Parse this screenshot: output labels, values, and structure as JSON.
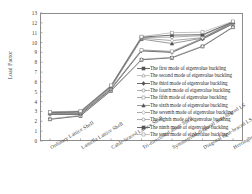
{
  "figure": {
    "title_remnant": "",
    "y_axis_label": "Load Factor",
    "x_axis_label": ""
  },
  "chart_data": {
    "type": "line",
    "title": "",
    "xlabel": "",
    "ylabel": "Load Factor",
    "ylim": [
      0,
      13
    ],
    "yticks": [
      0,
      1,
      2,
      3,
      4,
      5,
      6,
      7,
      8,
      9,
      10,
      11,
      12,
      13
    ],
    "grid": false,
    "legend_position": "lower-right-inside",
    "categories": [
      "Ordinary Lattice Shell",
      "Lamella Lattice Shell",
      "Cable-braced Lattice Shell",
      "Tri-direction Lattice Shell",
      "Symmetrical diagonal strut-braced LS",
      "Diagonal strut-braced LS",
      "Herringbone strut-braced LS"
    ],
    "series": [
      {
        "name": "The first mode of eigenvalue buckling",
        "marker": "filled-square",
        "values": [
          2.2,
          2.55,
          5.1,
          8.25,
          8.45,
          9.6,
          11.55
        ]
      },
      {
        "name": "The second mode of eigenvalue buckling",
        "marker": "open-triangle",
        "values": [
          2.25,
          2.6,
          5.15,
          8.3,
          8.5,
          9.65,
          11.6
        ]
      },
      {
        "name": "The third mode of eigenvalue buckling",
        "marker": "filled-diamond",
        "values": [
          2.7,
          2.7,
          5.25,
          9.15,
          9.0,
          10.35,
          11.9
        ]
      },
      {
        "name": "The fourth mode of eigenvalue buckling",
        "marker": "open-circle",
        "values": [
          2.75,
          2.75,
          5.3,
          9.2,
          9.05,
          10.4,
          11.95
        ]
      },
      {
        "name": "The fifth mode of eigenvalue buckling",
        "marker": "open-square",
        "values": [
          2.8,
          2.8,
          5.35,
          9.25,
          9.1,
          10.45,
          12.0
        ]
      },
      {
        "name": "The sixth mode of eigenvalue buckling",
        "marker": "filled-triangle",
        "values": [
          2.85,
          2.85,
          5.45,
          10.35,
          9.9,
          10.45,
          12.05
        ]
      },
      {
        "name": "The seventh mode of eigenvalue buckling",
        "marker": "open-diamond",
        "values": [
          2.88,
          2.9,
          5.5,
          10.45,
          10.2,
          10.5,
          12.05
        ]
      },
      {
        "name": "The eighth mode of eigenvalue buckling",
        "marker": "open-circle",
        "values": [
          2.9,
          2.95,
          5.55,
          10.5,
          10.55,
          10.7,
          12.1
        ]
      },
      {
        "name": "The ninth mode of eigenvalue buckling",
        "marker": "filled-square",
        "values": [
          2.92,
          3.0,
          5.6,
          10.55,
          10.75,
          10.8,
          12.1
        ]
      },
      {
        "name": "The tenth mode of eigenvalue buckling",
        "marker": "open-square",
        "values": [
          2.95,
          3.05,
          5.65,
          10.6,
          11.0,
          11.05,
          12.15
        ]
      }
    ]
  },
  "colors": {
    "axis": "#8d8d8d",
    "text": "#3a3a3a",
    "line_dark": "#555555",
    "line_mid": "#777777",
    "line_light": "#999999"
  }
}
